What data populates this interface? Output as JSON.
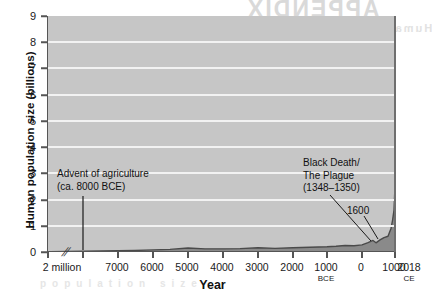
{
  "figure": {
    "background_color": "#ffffff",
    "plot_background_color": "#c6c6c6",
    "gridline_color": "#f2f2f2",
    "area_fill_color": "#8a8a8a",
    "area_line_color": "#4a4a4a"
  },
  "bleed_through": {
    "line1": "APPENDIX",
    "line2": "Human population growth",
    "line3": "population size"
  },
  "chart_data": {
    "type": "area",
    "title": "",
    "xlabel": "Year",
    "ylabel": "Human population size (billions)",
    "ylim": [
      0,
      9
    ],
    "ytick_labels": [
      "0",
      "1",
      "2",
      "3",
      "4",
      "5",
      "6",
      "7",
      "8",
      "9"
    ],
    "ytick_values": [
      0,
      1,
      2,
      3,
      4,
      5,
      6,
      7,
      8,
      9
    ],
    "grid": "horizontal",
    "legend": "none",
    "axis_break": {
      "symbol": "//",
      "between": [
        "2 million",
        "7000"
      ],
      "note": "x-axis is broken between 2 million BCE and 7000 BCE"
    },
    "xtick_labels": [
      {
        "label": "2 million",
        "sub": ""
      },
      {
        "label": "7000",
        "sub": ""
      },
      {
        "label": "6000",
        "sub": ""
      },
      {
        "label": "5000",
        "sub": ""
      },
      {
        "label": "4000",
        "sub": ""
      },
      {
        "label": "3000",
        "sub": ""
      },
      {
        "label": "2000",
        "sub": ""
      },
      {
        "label": "1000",
        "sub": "BCE"
      },
      {
        "label": "0",
        "sub": ""
      },
      {
        "label": "1000",
        "sub": ""
      },
      {
        "label": "2018",
        "sub": "CE"
      }
    ],
    "x": [
      "2 million BCE",
      "7000 BCE",
      "6500 BCE",
      "6000 BCE",
      "5500 BCE",
      "5000 BCE",
      "4500 BCE",
      "4000 BCE",
      "3500 BCE",
      "3000 BCE",
      "2500 BCE",
      "2000 BCE",
      "1500 BCE",
      "1000 BCE",
      "500 BCE",
      "0",
      "500 CE",
      "1000 CE",
      "1200 CE",
      "1340 CE",
      "1400 CE",
      "1500 CE",
      "1600 CE",
      "1700 CE",
      "1800 CE",
      "1850 CE",
      "1900 CE",
      "1950 CE",
      "1975 CE",
      "2000 CE",
      "2018 CE"
    ],
    "values": [
      0.01,
      0.05,
      0.06,
      0.08,
      0.1,
      0.15,
      0.12,
      0.12,
      0.13,
      0.16,
      0.14,
      0.16,
      0.18,
      0.2,
      0.22,
      0.25,
      0.24,
      0.27,
      0.36,
      0.44,
      0.35,
      0.46,
      0.55,
      0.6,
      0.9,
      1.2,
      1.6,
      2.5,
      4.0,
      6.1,
      7.6
    ],
    "annotations": [
      {
        "id": "advent-of-agriculture",
        "text": "Advent of agriculture\n(ca. 8000 BCE)",
        "points_to": "8000 BCE"
      },
      {
        "id": "black-death",
        "text": "Black Death/\nThe Plague\n(1348–1350)",
        "points_to": "1348-1350 CE"
      },
      {
        "id": "year-1600",
        "text": "1600",
        "points_to": "1600 CE"
      }
    ]
  }
}
